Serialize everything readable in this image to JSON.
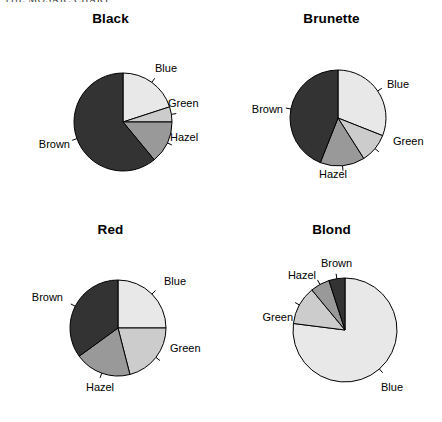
{
  "page": {
    "header_text": "THE MOSAIC CHART",
    "background_color": "#ffffff"
  },
  "palette": {
    "Brown": "#333333",
    "Blue": "#e8e8e8",
    "Hazel": "#999999",
    "Green": "#cccccc",
    "outline": "#000000"
  },
  "chart_data": [
    {
      "type": "pie",
      "title": "Black",
      "xlabel": "",
      "ylabel": "",
      "categories": [
        "Blue",
        "Green",
        "Hazel",
        "Brown"
      ],
      "values": [
        20,
        5,
        14,
        61
      ],
      "labels": [
        "Blue",
        "Green",
        "Hazel",
        "Brown"
      ],
      "colors": [
        "#e8e8e8",
        "#cccccc",
        "#999999",
        "#333333"
      ],
      "start_angle_deg": 0,
      "direction": "clockwise",
      "legend": "none",
      "grid": false
    },
    {
      "type": "pie",
      "title": "Brunette",
      "xlabel": "",
      "ylabel": "",
      "categories": [
        "Blue",
        "Green",
        "Hazel",
        "Brown"
      ],
      "values": [
        31,
        10,
        15,
        44
      ],
      "labels": [
        "Blue",
        "Green",
        "Hazel",
        "Brown"
      ],
      "colors": [
        "#e8e8e8",
        "#cccccc",
        "#999999",
        "#333333"
      ],
      "start_angle_deg": 0,
      "direction": "clockwise",
      "legend": "none",
      "grid": false
    },
    {
      "type": "pie",
      "title": "Red",
      "xlabel": "",
      "ylabel": "",
      "categories": [
        "Blue",
        "Green",
        "Hazel",
        "Brown"
      ],
      "values": [
        25,
        21,
        19,
        35
      ],
      "labels": [
        "Blue",
        "Green",
        "Hazel",
        "Brown"
      ],
      "colors": [
        "#e8e8e8",
        "#cccccc",
        "#999999",
        "#333333"
      ],
      "start_angle_deg": 0,
      "direction": "clockwise",
      "legend": "none",
      "grid": false
    },
    {
      "type": "pie",
      "title": "Blond",
      "xlabel": "",
      "ylabel": "",
      "categories": [
        "Blue",
        "Green",
        "Hazel",
        "Brown"
      ],
      "values": [
        77,
        12,
        6,
        5
      ],
      "labels": [
        "Blue",
        "Green",
        "Hazel",
        "Brown"
      ],
      "colors": [
        "#e8e8e8",
        "#cccccc",
        "#999999",
        "#333333"
      ],
      "start_angle_deg": 0,
      "direction": "clockwise",
      "legend": "none",
      "grid": false
    }
  ],
  "layout": {
    "panels": [
      {
        "cx": 123,
        "cy": 122,
        "r": 49,
        "label_placements": [
          {
            "label": "Blue",
            "x": 155,
            "y": 72,
            "anchor": "start",
            "tick": true
          },
          {
            "label": "Green",
            "x": 168,
            "y": 107,
            "anchor": "start",
            "tick": true
          },
          {
            "label": "Hazel",
            "x": 170,
            "y": 141,
            "anchor": "start",
            "tick": true
          },
          {
            "label": "Brown",
            "x": 70,
            "y": 148,
            "anchor": "end",
            "tick": true
          }
        ]
      },
      {
        "cx": 117,
        "cy": 118,
        "r": 48,
        "label_placements": [
          {
            "label": "Blue",
            "x": 166,
            "y": 88,
            "anchor": "start",
            "tick": true
          },
          {
            "label": "Green",
            "x": 172,
            "y": 145,
            "anchor": "start",
            "tick": true
          },
          {
            "label": "Hazel",
            "x": 112,
            "y": 178,
            "anchor": "middle",
            "tick": true
          },
          {
            "label": "Brown",
            "x": 62,
            "y": 113,
            "anchor": "end",
            "tick": true
          }
        ]
      },
      {
        "cx": 118,
        "cy": 117,
        "r": 48,
        "label_placements": [
          {
            "label": "Blue",
            "x": 164,
            "y": 74,
            "anchor": "start",
            "tick": true
          },
          {
            "label": "Green",
            "x": 170,
            "y": 141,
            "anchor": "start",
            "tick": true
          },
          {
            "label": "Hazel",
            "x": 100,
            "y": 180,
            "anchor": "middle",
            "tick": true
          },
          {
            "label": "Brown",
            "x": 63,
            "y": 90,
            "anchor": "end",
            "tick": true
          }
        ]
      },
      {
        "cx": 124,
        "cy": 119,
        "r": 52,
        "label_placements": [
          {
            "label": "Blue",
            "x": 160,
            "y": 180,
            "anchor": "start",
            "tick": true
          },
          {
            "label": "Green",
            "x": 72,
            "y": 110,
            "anchor": "end",
            "tick": true
          },
          {
            "label": "Hazel",
            "x": 95,
            "y": 68,
            "anchor": "end",
            "tick": true
          },
          {
            "label": "Brown",
            "x": 100,
            "y": 56,
            "anchor": "start",
            "tick": true
          }
        ]
      }
    ]
  }
}
